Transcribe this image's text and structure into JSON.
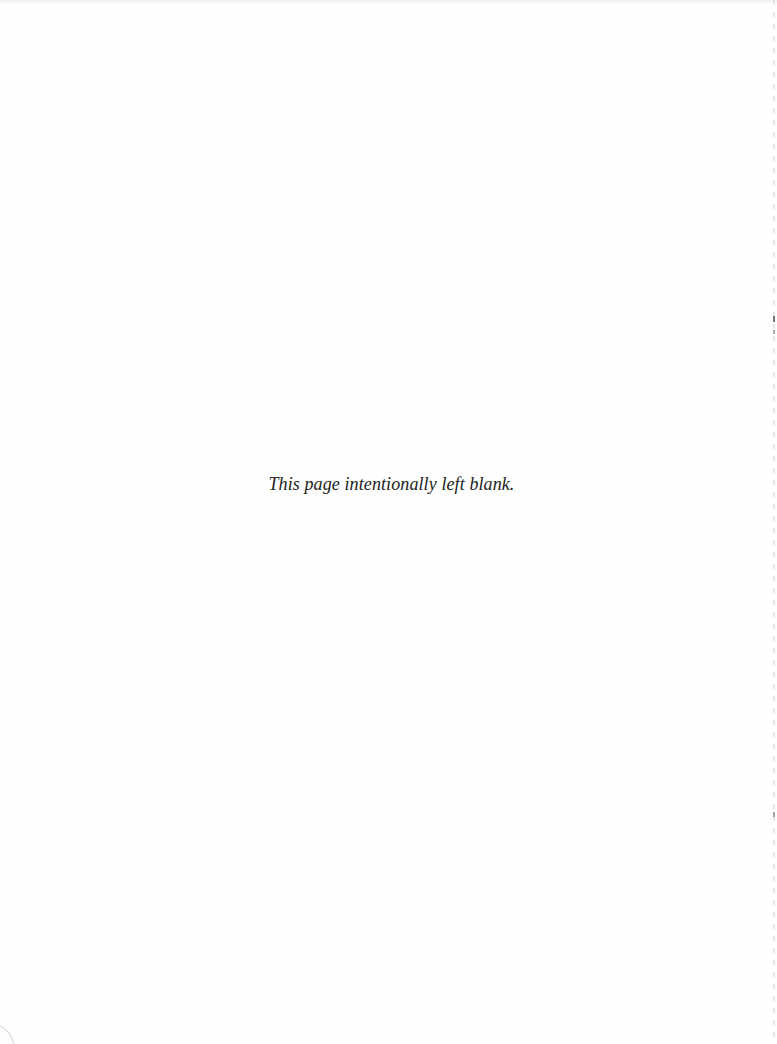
{
  "page": {
    "notice": "This page intentionally left blank.",
    "background_color": "#fefefe",
    "text_color": "#222222"
  }
}
